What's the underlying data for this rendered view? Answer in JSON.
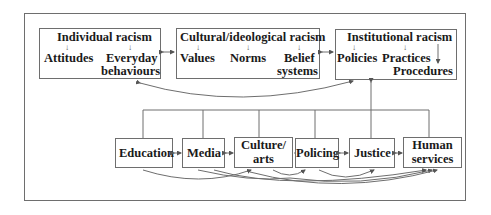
{
  "diagram": {
    "top_row": [
      {
        "id": "individual",
        "title": "Individual racism",
        "children": [
          "Attitudes",
          "Everyday",
          "behaviours"
        ]
      },
      {
        "id": "cultural",
        "title": "Cultural/ideological racism",
        "children": [
          "Values",
          "Norms",
          "Belief",
          "systems"
        ]
      },
      {
        "id": "institutional",
        "title": "Institutional racism",
        "children": [
          "Policies",
          "Practices",
          "Procedures"
        ]
      }
    ],
    "bottom_row": [
      {
        "id": "education",
        "label": "Education"
      },
      {
        "id": "media",
        "label": "Media"
      },
      {
        "id": "culture_arts",
        "label_line1": "Culture/",
        "label_line2": "arts"
      },
      {
        "id": "policing",
        "label": "Policing"
      },
      {
        "id": "justice",
        "label": "Justice"
      },
      {
        "id": "human_services",
        "label_line1": "Human",
        "label_line2": "services"
      }
    ],
    "connectors": {
      "top_bidirectional": [
        "individual<->cultural",
        "cultural<->institutional"
      ],
      "bottom_bidirectional": [
        "education<->media",
        "media<->culture_arts",
        "culture_arts<->policing",
        "policing<->justice",
        "justice<->human_services"
      ],
      "curve_individual_to_institutional": true,
      "bus_to_institutional": true
    },
    "colors": {
      "line": "#6e6e6e",
      "text": "#1a1a1a",
      "background": "#ffffff"
    }
  }
}
